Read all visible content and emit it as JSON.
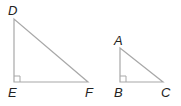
{
  "diagram": {
    "type": "similar-right-triangles",
    "line_color": "#a8a8a8",
    "label_color": "#222222",
    "triangles": [
      {
        "name": "DEF",
        "right_angle_at": "E",
        "vertices": {
          "D": {
            "label": "D",
            "x": 14,
            "y": 19
          },
          "E": {
            "label": "E",
            "x": 14,
            "y": 82
          },
          "F": {
            "label": "F",
            "x": 88,
            "y": 82
          }
        }
      },
      {
        "name": "ABC",
        "right_angle_at": "B",
        "vertices": {
          "A": {
            "label": "A",
            "x": 120,
            "y": 48
          },
          "B": {
            "label": "B",
            "x": 120,
            "y": 82
          },
          "C": {
            "label": "C",
            "x": 163,
            "y": 82
          }
        }
      }
    ]
  }
}
